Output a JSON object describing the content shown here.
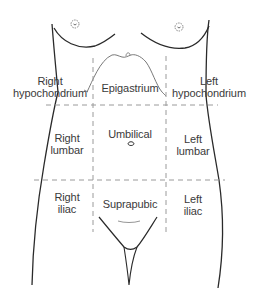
{
  "diagram": {
    "colors": {
      "outline": "#2a2a2a",
      "dashed": "#9a9a9a",
      "text": "#3a3a3a",
      "background": "#ffffff"
    },
    "regions": {
      "right_hypochondrium": {
        "line1": "Right",
        "line2": "hypochondrium"
      },
      "epigastrium": {
        "line1": "Epigastrium"
      },
      "left_hypochondrium": {
        "line1": "Left",
        "line2": "hypochondrium"
      },
      "right_lumbar": {
        "line1": "Right",
        "line2": "lumbar"
      },
      "umbilical": {
        "line1": "Umbilical"
      },
      "left_lumbar": {
        "line1": "Left",
        "line2": "lumbar"
      },
      "right_iliac": {
        "line1": "Right",
        "line2": "iliac"
      },
      "suprapubic": {
        "line1": "Suprapubic"
      },
      "left_iliac": {
        "line1": "Left",
        "line2": "iliac"
      }
    }
  }
}
